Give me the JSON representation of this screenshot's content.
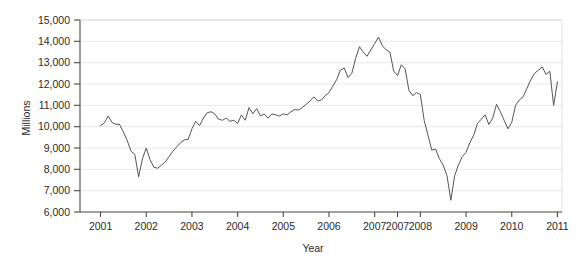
{
  "chart_data": {
    "type": "line",
    "title": "",
    "subtitle": "",
    "xlabel": "Year",
    "ylabel": "Millions",
    "ylim": [
      6000,
      15000
    ],
    "ytick_labels": [
      "6,000",
      "7,000",
      "8,000",
      "9,000",
      "10,000",
      "11,000",
      "12,000",
      "13,000",
      "14,000",
      "15,000"
    ],
    "ytick_values": [
      6000,
      7000,
      8000,
      9000,
      10000,
      11000,
      12000,
      13000,
      14000,
      15000
    ],
    "xtick_labels": [
      "2001",
      "2002",
      "2003",
      "2004",
      "2005",
      "2006",
      "2007",
      "2007",
      "2008",
      "2009",
      "2010",
      "2011"
    ],
    "xtick_positions": [
      2001,
      2002,
      2003,
      2004,
      2005,
      2006,
      2007,
      2007.5,
      2008,
      2009,
      2010,
      2011
    ],
    "xlim": [
      2000.55,
      2011.1
    ],
    "grid": "horizontal",
    "legend": "none",
    "series": [
      {
        "name": "Millions",
        "color": "#555555",
        "x": [
          2001.0,
          2001.083,
          2001.167,
          2001.25,
          2001.333,
          2001.417,
          2001.5,
          2001.583,
          2001.667,
          2001.75,
          2001.833,
          2001.917,
          2002.0,
          2002.083,
          2002.167,
          2002.25,
          2002.333,
          2002.417,
          2002.5,
          2002.583,
          2002.667,
          2002.75,
          2002.833,
          2002.917,
          2003.0,
          2003.083,
          2003.167,
          2003.25,
          2003.333,
          2003.417,
          2003.5,
          2003.583,
          2003.667,
          2003.75,
          2003.833,
          2003.917,
          2004.0,
          2004.083,
          2004.167,
          2004.25,
          2004.333,
          2004.417,
          2004.5,
          2004.583,
          2004.667,
          2004.75,
          2004.833,
          2004.917,
          2005.0,
          2005.083,
          2005.167,
          2005.25,
          2005.333,
          2005.417,
          2005.5,
          2005.583,
          2005.667,
          2005.75,
          2005.833,
          2005.917,
          2006.0,
          2006.083,
          2006.167,
          2006.25,
          2006.333,
          2006.417,
          2006.5,
          2006.583,
          2006.667,
          2006.75,
          2006.833,
          2006.917,
          2007.0,
          2007.083,
          2007.167,
          2007.25,
          2007.333,
          2007.417,
          2007.5,
          2007.583,
          2007.667,
          2007.75,
          2007.833,
          2007.917,
          2008.0,
          2008.083,
          2008.167,
          2008.25,
          2008.333,
          2008.417,
          2008.5,
          2008.583,
          2008.667,
          2008.75,
          2008.833,
          2008.917,
          2009.0,
          2009.083,
          2009.167,
          2009.25,
          2009.333,
          2009.417,
          2009.5,
          2009.583,
          2009.667,
          2009.75,
          2009.833,
          2009.917,
          2010.0,
          2010.083,
          2010.167,
          2010.25,
          2010.333,
          2010.417,
          2010.5,
          2010.583,
          2010.667,
          2010.75,
          2010.833,
          2010.917,
          2011.0
        ],
        "values": [
          10050,
          10180,
          10500,
          10200,
          10120,
          10100,
          9750,
          9350,
          8850,
          8700,
          7650,
          8500,
          9000,
          8450,
          8100,
          8050,
          8200,
          8350,
          8600,
          8850,
          9050,
          9250,
          9380,
          9400,
          9900,
          10250,
          10050,
          10400,
          10650,
          10700,
          10600,
          10350,
          10300,
          10400,
          10250,
          10300,
          10150,
          10550,
          10300,
          10900,
          10600,
          10850,
          10500,
          10600,
          10400,
          10600,
          10550,
          10500,
          10600,
          10550,
          10700,
          10800,
          10780,
          10900,
          11050,
          11200,
          11400,
          11200,
          11250,
          11450,
          11600,
          11900,
          12200,
          12650,
          12750,
          12300,
          12500,
          13200,
          13750,
          13500,
          13300,
          13600,
          13900,
          14200,
          13800,
          13600,
          13500,
          12600,
          12400,
          12900,
          12700,
          11700,
          11450,
          11600,
          11500,
          10300,
          9600,
          8900,
          8950,
          8500,
          8200,
          7700,
          6550,
          7700,
          8200,
          8600,
          8800,
          9250,
          9600,
          10150,
          10350,
          10550,
          10100,
          10400,
          11050,
          10700,
          10300,
          9900,
          10200,
          11000,
          11250,
          11400,
          11800,
          12200,
          12500,
          12650,
          12800,
          12450,
          12600,
          11000,
          12100
        ]
      }
    ]
  },
  "axes": {
    "ylabel": "Millions",
    "xlabel": "Year"
  }
}
